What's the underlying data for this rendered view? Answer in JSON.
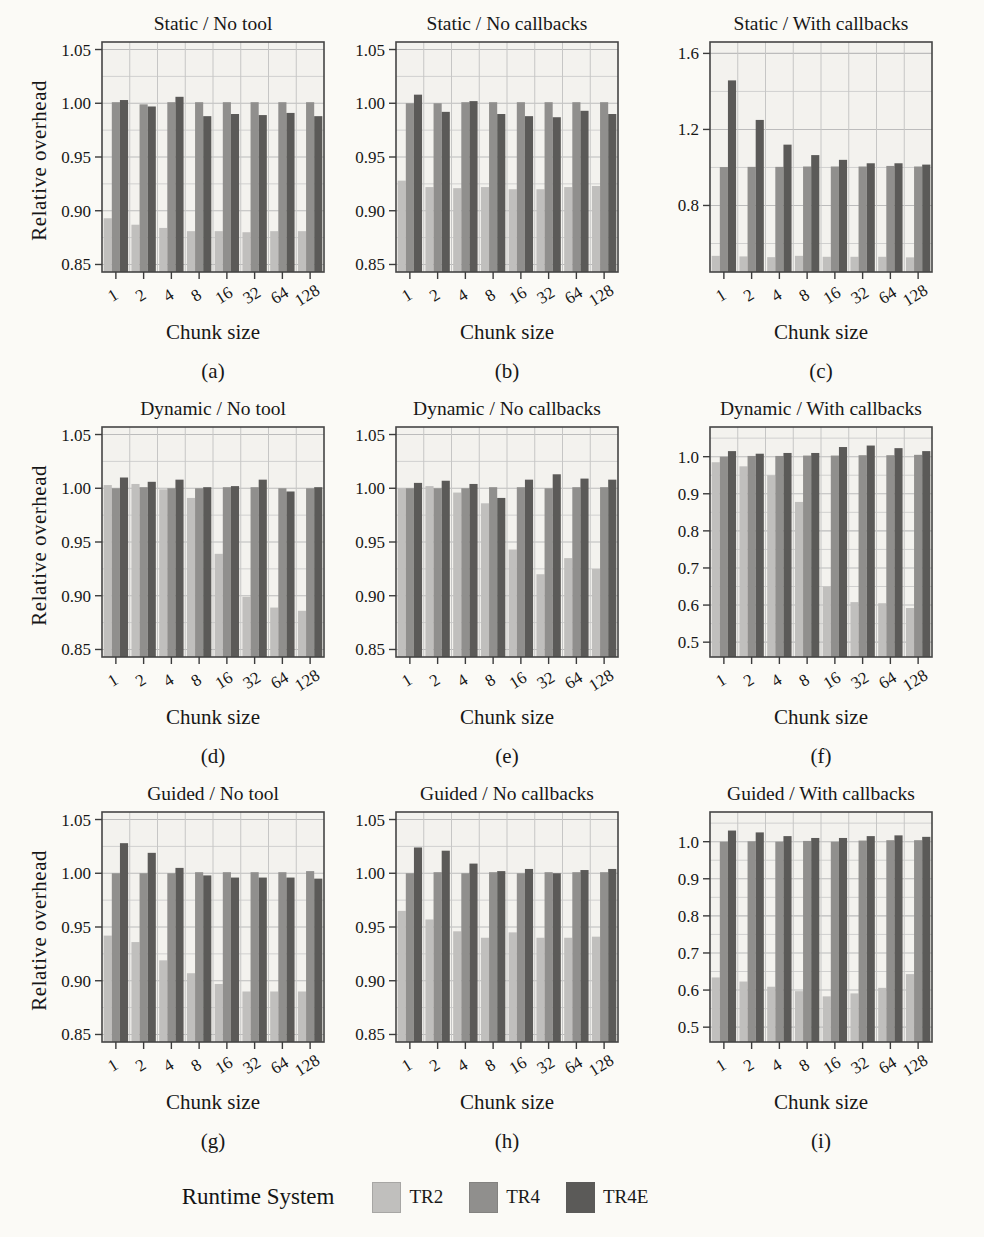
{
  "legend": {
    "title": "Runtime System",
    "items": [
      {
        "label": "TR2",
        "color": "#c0bfbd"
      },
      {
        "label": "TR4",
        "color": "#908f8d"
      },
      {
        "label": "TR4E",
        "color": "#5b5a58"
      }
    ]
  },
  "colors": {
    "TR2": "#c0bfbd",
    "TR4": "#908f8d",
    "TR4E": "#5b5a58",
    "plot_bg": "#f3f2ee",
    "grid_major": "#bcbcbc",
    "grid_minor": "#d0d0cf",
    "grid_vertical": "#c6c6c5",
    "border": "#454545",
    "tick": "#3c3c3c"
  },
  "chart_data": [
    {
      "type": "bar",
      "title": "Static / No tool",
      "caption": "(a)",
      "xlabel": "Chunk size",
      "ylabel": "Relative overhead",
      "show_ylabel": true,
      "categories": [
        "1",
        "2",
        "4",
        "8",
        "16",
        "32",
        "64",
        "128"
      ],
      "ylim": [
        0.843,
        1.057
      ],
      "yticks": [
        0.85,
        0.9,
        0.95,
        1.0,
        1.05
      ],
      "ytick_labels": [
        "0.85",
        "0.90",
        "0.95",
        "1.00",
        "1.05"
      ],
      "yminor": [
        0.875,
        0.925,
        0.975,
        1.025
      ],
      "grid": true,
      "legend_position": "bottom",
      "series": [
        {
          "name": "TR2",
          "values": [
            0.893,
            0.887,
            0.884,
            0.881,
            0.881,
            0.88,
            0.881,
            0.881
          ]
        },
        {
          "name": "TR4",
          "values": [
            1.001,
            0.999,
            1.001,
            1.001,
            1.001,
            1.001,
            1.001,
            1.001
          ]
        },
        {
          "name": "TR4E",
          "values": [
            1.003,
            0.997,
            1.006,
            0.988,
            0.99,
            0.989,
            0.991,
            0.988
          ]
        }
      ]
    },
    {
      "type": "bar",
      "title": "Static / No callbacks",
      "caption": "(b)",
      "xlabel": "Chunk size",
      "ylabel": "Relative overhead",
      "show_ylabel": false,
      "categories": [
        "1",
        "2",
        "4",
        "8",
        "16",
        "32",
        "64",
        "128"
      ],
      "ylim": [
        0.843,
        1.057
      ],
      "yticks": [
        0.85,
        0.9,
        0.95,
        1.0,
        1.05
      ],
      "ytick_labels": [
        "0.85",
        "0.90",
        "0.95",
        "1.00",
        "1.05"
      ],
      "yminor": [
        0.875,
        0.925,
        0.975,
        1.025
      ],
      "grid": true,
      "series": [
        {
          "name": "TR2",
          "values": [
            0.928,
            0.922,
            0.921,
            0.922,
            0.92,
            0.92,
            0.922,
            0.923
          ]
        },
        {
          "name": "TR4",
          "values": [
            1.0,
            1.0,
            1.001,
            1.001,
            1.001,
            1.001,
            1.001,
            1.001
          ]
        },
        {
          "name": "TR4E",
          "values": [
            1.008,
            0.992,
            1.002,
            0.99,
            0.988,
            0.987,
            0.993,
            0.99
          ]
        }
      ]
    },
    {
      "type": "bar",
      "title": "Static / With callbacks",
      "caption": "(c)",
      "xlabel": "Chunk size",
      "ylabel": "Relative overhead",
      "show_ylabel": false,
      "categories": [
        "1",
        "2",
        "4",
        "8",
        "16",
        "32",
        "64",
        "128"
      ],
      "ylim": [
        0.45,
        1.66
      ],
      "yticks": [
        0.8,
        1.2,
        1.6
      ],
      "ytick_labels": [
        "0.8",
        "1.2",
        "1.6"
      ],
      "yminor": [
        0.6,
        1.0,
        1.4
      ],
      "grid": true,
      "series": [
        {
          "name": "TR2",
          "values": [
            0.535,
            0.532,
            0.528,
            0.535,
            0.53,
            0.53,
            0.53,
            0.527
          ]
        },
        {
          "name": "TR4",
          "values": [
            1.002,
            1.003,
            1.003,
            1.005,
            1.005,
            1.005,
            1.008,
            1.005
          ]
        },
        {
          "name": "TR4E",
          "values": [
            1.458,
            1.25,
            1.12,
            1.065,
            1.04,
            1.022,
            1.022,
            1.015
          ]
        }
      ]
    },
    {
      "type": "bar",
      "title": "Dynamic / No tool",
      "caption": "(d)",
      "xlabel": "Chunk size",
      "ylabel": "Relative overhead",
      "show_ylabel": true,
      "categories": [
        "1",
        "2",
        "4",
        "8",
        "16",
        "32",
        "64",
        "128"
      ],
      "ylim": [
        0.843,
        1.057
      ],
      "yticks": [
        0.85,
        0.9,
        0.95,
        1.0,
        1.05
      ],
      "ytick_labels": [
        "0.85",
        "0.90",
        "0.95",
        "1.00",
        "1.05"
      ],
      "yminor": [
        0.875,
        0.925,
        0.975,
        1.025
      ],
      "grid": true,
      "series": [
        {
          "name": "TR2",
          "values": [
            1.003,
            1.004,
            0.999,
            0.991,
            0.939,
            0.899,
            0.889,
            0.886
          ]
        },
        {
          "name": "TR4",
          "values": [
            1.0,
            1.001,
            1.0,
            1.0,
            1.001,
            1.001,
            1.0,
            1.0
          ]
        },
        {
          "name": "TR4E",
          "values": [
            1.01,
            1.006,
            1.008,
            1.001,
            1.002,
            1.008,
            0.997,
            1.001
          ]
        }
      ]
    },
    {
      "type": "bar",
      "title": "Dynamic / No callbacks",
      "caption": "(e)",
      "xlabel": "Chunk size",
      "ylabel": "Relative overhead",
      "show_ylabel": false,
      "categories": [
        "1",
        "2",
        "4",
        "8",
        "16",
        "32",
        "64",
        "128"
      ],
      "ylim": [
        0.843,
        1.057
      ],
      "yticks": [
        0.85,
        0.9,
        0.95,
        1.0,
        1.05
      ],
      "ytick_labels": [
        "0.85",
        "0.90",
        "0.95",
        "1.00",
        "1.05"
      ],
      "yminor": [
        0.875,
        0.925,
        0.975,
        1.025
      ],
      "grid": true,
      "series": [
        {
          "name": "TR2",
          "values": [
            1.0,
            1.002,
            0.996,
            0.986,
            0.943,
            0.92,
            0.935,
            0.925
          ]
        },
        {
          "name": "TR4",
          "values": [
            1.0,
            1.0,
            1.0,
            1.001,
            1.001,
            1.0,
            1.001,
            1.001
          ]
        },
        {
          "name": "TR4E",
          "values": [
            1.005,
            1.007,
            1.004,
            0.991,
            1.008,
            1.013,
            1.009,
            1.008
          ]
        }
      ]
    },
    {
      "type": "bar",
      "title": "Dynamic / With callbacks",
      "caption": "(f)",
      "xlabel": "Chunk size",
      "ylabel": "Relative overhead",
      "show_ylabel": false,
      "categories": [
        "1",
        "2",
        "4",
        "8",
        "16",
        "32",
        "64",
        "128"
      ],
      "ylim": [
        0.46,
        1.08
      ],
      "yticks": [
        0.5,
        0.6,
        0.7,
        0.8,
        0.9,
        1.0
      ],
      "ytick_labels": [
        "0.5",
        "0.6",
        "0.7",
        "0.8",
        "0.9",
        "1.0"
      ],
      "yminor": [
        0.55,
        0.65,
        0.75,
        0.85,
        0.95,
        1.05
      ],
      "grid": true,
      "series": [
        {
          "name": "TR2",
          "values": [
            0.985,
            0.974,
            0.95,
            0.878,
            0.65,
            0.608,
            0.605,
            0.592
          ]
        },
        {
          "name": "TR4",
          "values": [
            1.0,
            1.002,
            1.002,
            1.003,
            1.003,
            1.004,
            1.004,
            1.005
          ]
        },
        {
          "name": "TR4E",
          "values": [
            1.015,
            1.008,
            1.01,
            1.01,
            1.026,
            1.03,
            1.023,
            1.015
          ]
        }
      ]
    },
    {
      "type": "bar",
      "title": "Guided / No tool",
      "caption": "(g)",
      "xlabel": "Chunk size",
      "ylabel": "Relative overhead",
      "show_ylabel": true,
      "categories": [
        "1",
        "2",
        "4",
        "8",
        "16",
        "32",
        "64",
        "128"
      ],
      "ylim": [
        0.843,
        1.057
      ],
      "yticks": [
        0.85,
        0.9,
        0.95,
        1.0,
        1.05
      ],
      "ytick_labels": [
        "0.85",
        "0.90",
        "0.95",
        "1.00",
        "1.05"
      ],
      "yminor": [
        0.875,
        0.925,
        0.975,
        1.025
      ],
      "grid": true,
      "series": [
        {
          "name": "TR2",
          "values": [
            0.942,
            0.936,
            0.919,
            0.907,
            0.897,
            0.89,
            0.89,
            0.89
          ]
        },
        {
          "name": "TR4",
          "values": [
            1.0,
            1.0,
            1.0,
            1.001,
            1.001,
            1.001,
            1.001,
            1.002
          ]
        },
        {
          "name": "TR4E",
          "values": [
            1.028,
            1.019,
            1.005,
            0.998,
            0.996,
            0.996,
            0.996,
            0.995
          ]
        }
      ]
    },
    {
      "type": "bar",
      "title": "Guided / No callbacks",
      "caption": "(h)",
      "xlabel": "Chunk size",
      "ylabel": "Relative overhead",
      "show_ylabel": false,
      "categories": [
        "1",
        "2",
        "4",
        "8",
        "16",
        "32",
        "64",
        "128"
      ],
      "ylim": [
        0.843,
        1.057
      ],
      "yticks": [
        0.85,
        0.9,
        0.95,
        1.0,
        1.05
      ],
      "ytick_labels": [
        "0.85",
        "0.90",
        "0.95",
        "1.00",
        "1.05"
      ],
      "yminor": [
        0.875,
        0.925,
        0.975,
        1.025
      ],
      "grid": true,
      "series": [
        {
          "name": "TR2",
          "values": [
            0.965,
            0.957,
            0.946,
            0.94,
            0.945,
            0.94,
            0.94,
            0.941
          ]
        },
        {
          "name": "TR4",
          "values": [
            1.0,
            1.001,
            1.0,
            1.001,
            1.0,
            1.001,
            1.001,
            1.001
          ]
        },
        {
          "name": "TR4E",
          "values": [
            1.024,
            1.021,
            1.009,
            1.002,
            1.004,
            1.0,
            1.003,
            1.004
          ]
        }
      ]
    },
    {
      "type": "bar",
      "title": "Guided / With callbacks",
      "caption": "(i)",
      "xlabel": "Chunk size",
      "ylabel": "Relative overhead",
      "show_ylabel": false,
      "categories": [
        "1",
        "2",
        "4",
        "8",
        "16",
        "32",
        "64",
        "128"
      ],
      "ylim": [
        0.46,
        1.08
      ],
      "yticks": [
        0.5,
        0.6,
        0.7,
        0.8,
        0.9,
        1.0
      ],
      "ytick_labels": [
        "0.5",
        "0.6",
        "0.7",
        "0.8",
        "0.9",
        "1.0"
      ],
      "yminor": [
        0.55,
        0.65,
        0.75,
        0.85,
        0.95,
        1.05
      ],
      "grid": true,
      "series": [
        {
          "name": "TR2",
          "values": [
            0.634,
            0.623,
            0.609,
            0.597,
            0.583,
            0.591,
            0.606,
            0.643
          ]
        },
        {
          "name": "TR4",
          "values": [
            1.0,
            1.001,
            1.0,
            1.002,
            1.0,
            1.003,
            1.004,
            1.004
          ]
        },
        {
          "name": "TR4E",
          "values": [
            1.03,
            1.025,
            1.015,
            1.01,
            1.01,
            1.015,
            1.017,
            1.013
          ]
        }
      ]
    }
  ]
}
